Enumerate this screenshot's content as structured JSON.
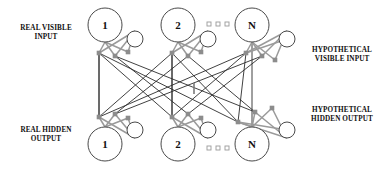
{
  "diagram": {
    "type": "neural-network-diagram",
    "colors": {
      "background": "#ffffff",
      "real_edge": "#2b2b2b",
      "hypothetical_edge": "#9a9a9a",
      "node_stroke": "#4a4a4a",
      "connector_square": "#8c8c8c",
      "text": "#111111"
    },
    "labels": {
      "top_left": {
        "line1": "REAL VISIBLE",
        "line2": "INPUT"
      },
      "bottom_left": {
        "line1": "REAL HIDDEN",
        "line2": "OUTPUT"
      },
      "top_right": {
        "line1": "HYPOTHETICAL",
        "line2": "VISIBLE INPUT"
      },
      "bottom_right": {
        "line1": "HYPOTHETICAL",
        "line2": "HIDDEN OUTPUT"
      }
    },
    "visible_layer": {
      "name": "visible",
      "nodes": [
        {
          "label": "1",
          "cx": 105,
          "cy": 25,
          "r": 17
        },
        {
          "label": "2",
          "cx": 178,
          "cy": 25,
          "r": 17
        },
        {
          "label": "N",
          "cx": 252,
          "cy": 25,
          "r": 17
        }
      ],
      "hypothetical_nodes": [
        {
          "cx": 135,
          "cy": 39,
          "r": 8
        },
        {
          "cx": 208,
          "cy": 39,
          "r": 8
        },
        {
          "cx": 287,
          "cy": 39,
          "r": 8
        }
      ],
      "ellipsis": [
        {
          "x": 207,
          "y": 22
        },
        {
          "x": 216,
          "y": 22
        },
        {
          "x": 225,
          "y": 22
        }
      ]
    },
    "hidden_layer": {
      "name": "hidden",
      "nodes": [
        {
          "label": "1",
          "cx": 105,
          "cy": 144,
          "r": 17
        },
        {
          "label": "2",
          "cx": 178,
          "cy": 144,
          "r": 17
        },
        {
          "label": "N",
          "cx": 252,
          "cy": 144,
          "r": 17
        }
      ],
      "hypothetical_nodes": [
        {
          "cx": 135,
          "cy": 130,
          "r": 8
        },
        {
          "cx": 208,
          "cy": 130,
          "r": 8
        },
        {
          "cx": 287,
          "cy": 130,
          "r": 8
        }
      ],
      "ellipsis": [
        {
          "x": 207,
          "y": 146
        },
        {
          "x": 216,
          "y": 146
        },
        {
          "x": 225,
          "y": 146
        }
      ]
    },
    "connectors": {
      "note": "small gray squares where edges attach",
      "top": [
        {
          "x": 99,
          "y": 53
        },
        {
          "x": 115,
          "y": 56
        },
        {
          "x": 128,
          "y": 52
        },
        {
          "x": 172,
          "y": 53
        },
        {
          "x": 188,
          "y": 56
        },
        {
          "x": 201,
          "y": 52
        },
        {
          "x": 246,
          "y": 53
        },
        {
          "x": 262,
          "y": 56
        },
        {
          "x": 275,
          "y": 60
        }
      ],
      "bottom": [
        {
          "x": 99,
          "y": 117
        },
        {
          "x": 115,
          "y": 114
        },
        {
          "x": 128,
          "y": 118
        },
        {
          "x": 172,
          "y": 117
        },
        {
          "x": 188,
          "y": 114
        },
        {
          "x": 201,
          "y": 118
        },
        {
          "x": 238,
          "y": 122
        },
        {
          "x": 255,
          "y": 112
        },
        {
          "x": 272,
          "y": 108
        }
      ]
    },
    "edges": {
      "real_count": 9,
      "hypothetical_count": 18,
      "description": "each visible unit connects to every hidden unit; gray edges link real units to their hypothetical counterparts"
    },
    "tick_marker": {
      "x": 194,
      "y": 83,
      "height": 11
    }
  }
}
